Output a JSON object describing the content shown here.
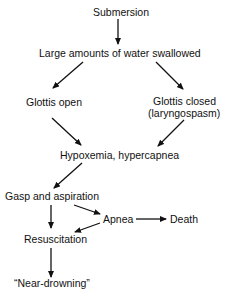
{
  "diagram": {
    "type": "flowchart",
    "nodes": {
      "submersion": "Submersion",
      "water_swallowed": "Large amounts of water swallowed",
      "glottis_open": "Glottis open",
      "glottis_closed_line1": "Glottis closed",
      "glottis_closed_line2": "(laryngospasm)",
      "hypoxemia": "Hypoxemia, hypercapnea",
      "gasp": "Gasp and aspiration",
      "apnea": "Apnea",
      "death": "Death",
      "resuscitation": "Resuscitation",
      "near_drowning": "“Near-drowning”"
    },
    "edges": [
      {
        "from": "Submersion",
        "to": "Large amounts of water swallowed"
      },
      {
        "from": "Large amounts of water swallowed",
        "to": "Glottis open"
      },
      {
        "from": "Large amounts of water swallowed",
        "to": "Glottis closed (laryngospasm)"
      },
      {
        "from": "Glottis open",
        "to": "Hypoxemia, hypercapnea"
      },
      {
        "from": "Glottis closed (laryngospasm)",
        "to": "Hypoxemia, hypercapnea"
      },
      {
        "from": "Hypoxemia, hypercapnea",
        "to": "Gasp and aspiration"
      },
      {
        "from": "Gasp and aspiration",
        "to": "Resuscitation"
      },
      {
        "from": "Gasp and aspiration",
        "to": "Apnea"
      },
      {
        "from": "Apnea",
        "to": "Death"
      },
      {
        "from": "Apnea",
        "to": "Resuscitation"
      },
      {
        "from": "Resuscitation",
        "to": "Near-drowning"
      }
    ],
    "colors": {
      "ink": "#111111",
      "background": "#ffffff"
    }
  }
}
